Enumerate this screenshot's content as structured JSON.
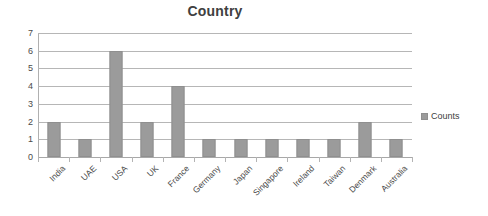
{
  "chart_data": {
    "type": "bar",
    "title": "Country",
    "xlabel": "",
    "ylabel": "",
    "categories": [
      "India",
      "UAE",
      "USA",
      "UK",
      "France",
      "Germany",
      "Japan",
      "Singapore",
      "Ireland",
      "Taiwan",
      "Denmark",
      "Australia"
    ],
    "series": [
      {
        "name": "Counts",
        "values": [
          2,
          1,
          6,
          2,
          4,
          1,
          1,
          1,
          1,
          1,
          2,
          1
        ]
      }
    ],
    "ylim": [
      0,
      7
    ],
    "ytick_labels": [
      "7",
      "6",
      "5",
      "4",
      "3",
      "2",
      "1",
      "0"
    ],
    "ytick_values": [
      7,
      6,
      5,
      4,
      3,
      2,
      1,
      0
    ],
    "grid": true,
    "legend_position": "right",
    "bar_color": "#9b9b9b",
    "gridline_color": "#b6b6b6",
    "title_color": "#404040",
    "background_color": "#ffffff"
  },
  "legend": {
    "entries": [
      {
        "label": "Counts",
        "color": "#9b9b9b"
      }
    ]
  }
}
